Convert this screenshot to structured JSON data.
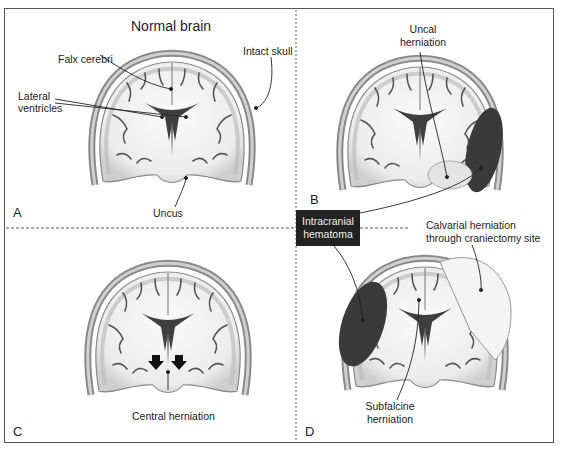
{
  "figure": {
    "panels": [
      {
        "id": "A",
        "letter": "A",
        "title": "Normal brain",
        "labels": {
          "falx": "Falx cerebri",
          "ventricles_1": "Lateral",
          "ventricles_2": "ventricles",
          "skull": "Intact skull",
          "uncus": "Uncus"
        }
      },
      {
        "id": "B",
        "letter": "B",
        "labels": {
          "uncal_1": "Uncal",
          "uncal_2": "herniation"
        }
      },
      {
        "id": "C",
        "letter": "C",
        "labels": {
          "central": "Central herniation"
        }
      },
      {
        "id": "D",
        "letter": "D",
        "labels": {
          "calvarial_1": "Calvarial herniation",
          "calvarial_2": "through craniectomy site",
          "subfalcine_1": "Subfalcine",
          "subfalcine_2": "herniation"
        }
      }
    ],
    "shared_label": {
      "line1": "Intracranial",
      "line2": "hematoma"
    },
    "colors": {
      "hematoma": "#3a3a3a",
      "skull": "#9a9a9a",
      "brain_white": "#f2f2f2",
      "brain_gray": "#c8c8c8",
      "border": "#555555",
      "label_box": "#222222"
    }
  }
}
